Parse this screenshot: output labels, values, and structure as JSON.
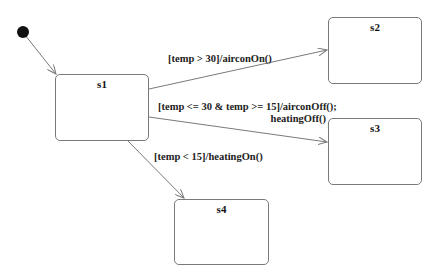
{
  "diagram": {
    "type": "state-machine",
    "initial_node": {
      "cx": 23,
      "cy": 32
    },
    "states": [
      {
        "id": "s1",
        "name": "s1",
        "x": 55,
        "y": 74,
        "w": 94,
        "h": 67
      },
      {
        "id": "s2",
        "name": "s2",
        "x": 328,
        "y": 17,
        "w": 94,
        "h": 67
      },
      {
        "id": "s3",
        "name": "s3",
        "x": 328,
        "y": 118,
        "w": 94,
        "h": 67
      },
      {
        "id": "s4",
        "name": "s4",
        "x": 174,
        "y": 199,
        "w": 95,
        "h": 66
      }
    ],
    "transitions": [
      {
        "from": "initial",
        "to": "s1",
        "label": ""
      },
      {
        "from": "s1",
        "to": "s2",
        "label": "[temp > 30]/airconOn()"
      },
      {
        "from": "s1",
        "to": "s3",
        "label_line1": "[temp <= 30 & temp >= 15]/airconOff();",
        "label_line2": "heatingOff()"
      },
      {
        "from": "s1",
        "to": "s4",
        "label": "[temp < 15]/heatingOn()"
      }
    ],
    "colors": {
      "line": "#7a7a7a",
      "text": "#222222",
      "initial": "#111111"
    }
  }
}
